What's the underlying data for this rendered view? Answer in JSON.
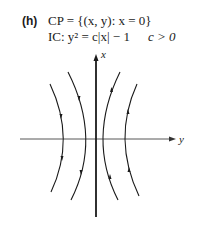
{
  "figure": {
    "part_label": "(h)",
    "line1": "CP = {(x, y): x = 0}",
    "line2_left": "IC: y² = c|x| − 1",
    "line2_right": "c > 0",
    "axis_x_label": "x",
    "axis_y_label": "y"
  },
  "diagram": {
    "curves": [
      {
        "name": "outer-left",
        "direction": "down"
      },
      {
        "name": "inner-left",
        "direction": "down"
      },
      {
        "name": "inner-right",
        "direction": "up"
      },
      {
        "name": "outer-right",
        "direction": "up"
      }
    ],
    "stroke_color": "#1a1a1a"
  }
}
